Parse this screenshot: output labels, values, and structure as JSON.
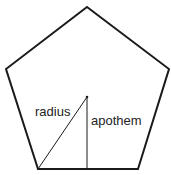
{
  "diagram": {
    "shape": "regular pentagon",
    "labels": {
      "radius": "radius",
      "apothem": "apothem"
    },
    "colors": {
      "stroke": "#1a1a1a",
      "background": "#ffffff"
    }
  }
}
